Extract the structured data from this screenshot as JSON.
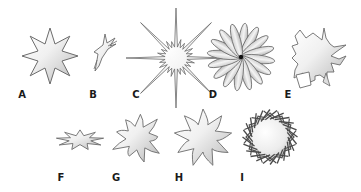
{
  "figure": {
    "stroke_color": "#6b6b6b",
    "fill_light": "#fbfbfb",
    "fill_dark": "#bdbdbd",
    "background": "#ffffff"
  },
  "shapes": [
    {
      "id": "A",
      "label": "A",
      "kind": "regular-8-point-star",
      "cx": 50,
      "cy": 56,
      "label_x": 22,
      "label_y": 95
    },
    {
      "id": "B",
      "label": "B",
      "kind": "collapsed-star",
      "cx": 102,
      "cy": 52,
      "label_x": 93,
      "label_y": 95
    },
    {
      "id": "C",
      "label": "C",
      "kind": "starburst-long-rays",
      "cx": 176,
      "cy": 58,
      "label_x": 136,
      "label_y": 95
    },
    {
      "id": "D",
      "label": "D",
      "kind": "flower-petals",
      "cx": 241,
      "cy": 57,
      "label_x": 213,
      "label_y": 95
    },
    {
      "id": "E",
      "label": "E",
      "kind": "irregular-jagged",
      "cx": 318,
      "cy": 56,
      "label_x": 288,
      "label_y": 95
    },
    {
      "id": "F",
      "label": "F",
      "kind": "flattened-star",
      "cx": 80,
      "cy": 140,
      "label_x": 61,
      "label_y": 178
    },
    {
      "id": "G",
      "label": "G",
      "kind": "curvy-star",
      "cx": 138,
      "cy": 138,
      "label_x": 116,
      "label_y": 178
    },
    {
      "id": "H",
      "label": "H",
      "kind": "pinwheel-star",
      "cx": 203,
      "cy": 138,
      "label_x": 179,
      "label_y": 178
    },
    {
      "id": "I",
      "label": "I",
      "kind": "spiky-wreath",
      "cx": 270,
      "cy": 137,
      "label_x": 242,
      "label_y": 178
    }
  ]
}
